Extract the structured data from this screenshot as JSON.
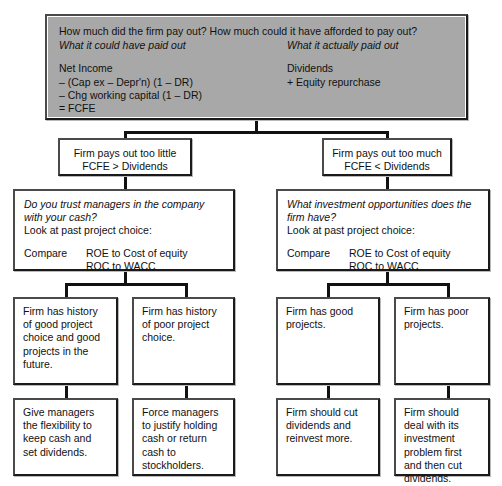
{
  "diagram": {
    "colors": {
      "header_fill": "#a8a8a8",
      "box_fill": "#ffffff",
      "line": "#111111",
      "border_light": "#4a4a4a",
      "border_dark": "#1a1a1a"
    },
    "header": {
      "question": "How much did the firm pay out? How much could it have afforded to pay out?",
      "left_caption": "What it could have paid out",
      "right_caption": "What it actually paid out",
      "left_lines": [
        "Net Income",
        "– (Cap ex – Depr'n) (1 – DR)",
        "– Chg working capital (1 – DR)",
        "= FCFE"
      ],
      "right_lines": [
        "Dividends",
        "+ Equity repurchase"
      ]
    },
    "branches": {
      "left": {
        "verdict_line1": "Firm pays out too little",
        "verdict_line2": "FCFE > Dividends",
        "question_line1": "Do you trust managers in the company",
        "question_line2": "with your cash?",
        "instruction": "Look at past project choice:",
        "compare_label": "Compare",
        "compare_line1": "ROE to Cost of equity",
        "compare_line2": "ROC to WACC",
        "outcome_a": "Firm has history of good project choice and good projects in the future.",
        "outcome_b": "Firm has history of poor project choice.",
        "action_a": "Give managers the flexibility to keep cash and set dividends.",
        "action_b": "Force managers to justify holding cash or return cash to stockholders."
      },
      "right": {
        "verdict_line1": "Firm pays out too much",
        "verdict_line2": "FCFE < Dividends",
        "question_line1": "What investment opportunities does the",
        "question_line2": "firm have?",
        "instruction": "Look at past project choice:",
        "compare_label": "Compare",
        "compare_line1": "ROE to Cost of equity",
        "compare_line2": "ROC to WACC",
        "outcome_a": "Firm has good projects.",
        "outcome_b": "Firm has poor projects.",
        "action_a": "Firm should cut dividends and reinvest more.",
        "action_b": "Firm should deal with its investment problem first and then cut dividends."
      }
    }
  }
}
